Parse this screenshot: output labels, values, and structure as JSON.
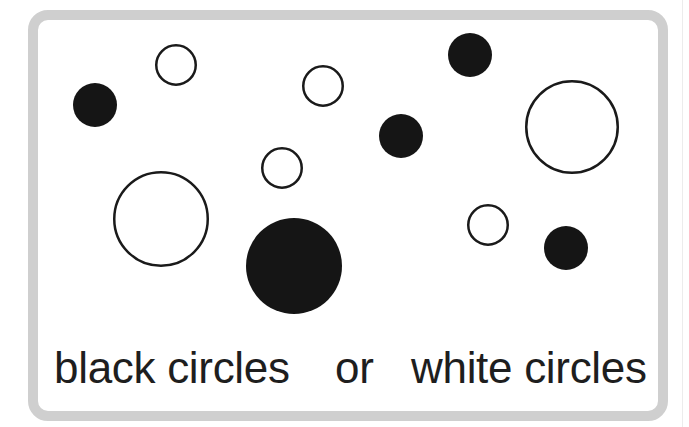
{
  "figure": {
    "frame": {
      "border_color": "#cfcfcf",
      "background": "#ffffff"
    },
    "circles": [
      {
        "id": 1,
        "kind": "black",
        "cx": 95,
        "cy": 105,
        "r": 22
      },
      {
        "id": 2,
        "kind": "white",
        "cx": 176,
        "cy": 65,
        "r": 21
      },
      {
        "id": 3,
        "kind": "white",
        "cx": 323,
        "cy": 86,
        "r": 21
      },
      {
        "id": 4,
        "kind": "black",
        "cx": 470,
        "cy": 55,
        "r": 22
      },
      {
        "id": 5,
        "kind": "black",
        "cx": 401,
        "cy": 136,
        "r": 22
      },
      {
        "id": 6,
        "kind": "white",
        "cx": 572,
        "cy": 127,
        "r": 47
      },
      {
        "id": 7,
        "kind": "white",
        "cx": 282,
        "cy": 168,
        "r": 21
      },
      {
        "id": 8,
        "kind": "white",
        "cx": 161,
        "cy": 219,
        "r": 48
      },
      {
        "id": 9,
        "kind": "black",
        "cx": 294,
        "cy": 266,
        "r": 48
      },
      {
        "id": 10,
        "kind": "white",
        "cx": 488,
        "cy": 225,
        "r": 21
      },
      {
        "id": 11,
        "kind": "black",
        "cx": 566,
        "cy": 248,
        "r": 22
      }
    ],
    "counts": {
      "black": 5,
      "white": 6
    },
    "colors": {
      "black_fill": "#151515",
      "white_fill": "#ffffff",
      "outline": "#1a1a1a"
    },
    "caption": {
      "option_a": "black circles",
      "connector": "or",
      "option_b": "white circles"
    }
  }
}
